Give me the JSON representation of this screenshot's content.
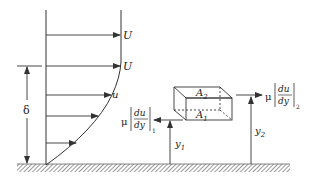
{
  "diagram": {
    "colors": {
      "stroke": "#333333",
      "hatch": "#555555",
      "background": "#ffffff"
    },
    "labels": {
      "U_top": "U",
      "U_edge": "U",
      "u_local": "u",
      "delta": "δ",
      "A2": "A",
      "A2_sub": "2",
      "A1": "A",
      "A1_sub": "1",
      "mu": "μ",
      "du": "du",
      "dy": "dy",
      "sub1": "1",
      "sub2": "2",
      "y1": "y",
      "y1_sub": "1",
      "y2": "y",
      "y2_sub": "2"
    },
    "velocity_arrows": [
      {
        "y": 35,
        "x_end": 120,
        "label": "U"
      },
      {
        "y": 66,
        "x_end": 120,
        "label": "U"
      },
      {
        "y": 95,
        "x_end": 110,
        "label": "u"
      },
      {
        "y": 116,
        "x_end": 97
      },
      {
        "y": 143,
        "x_end": 75
      }
    ]
  }
}
